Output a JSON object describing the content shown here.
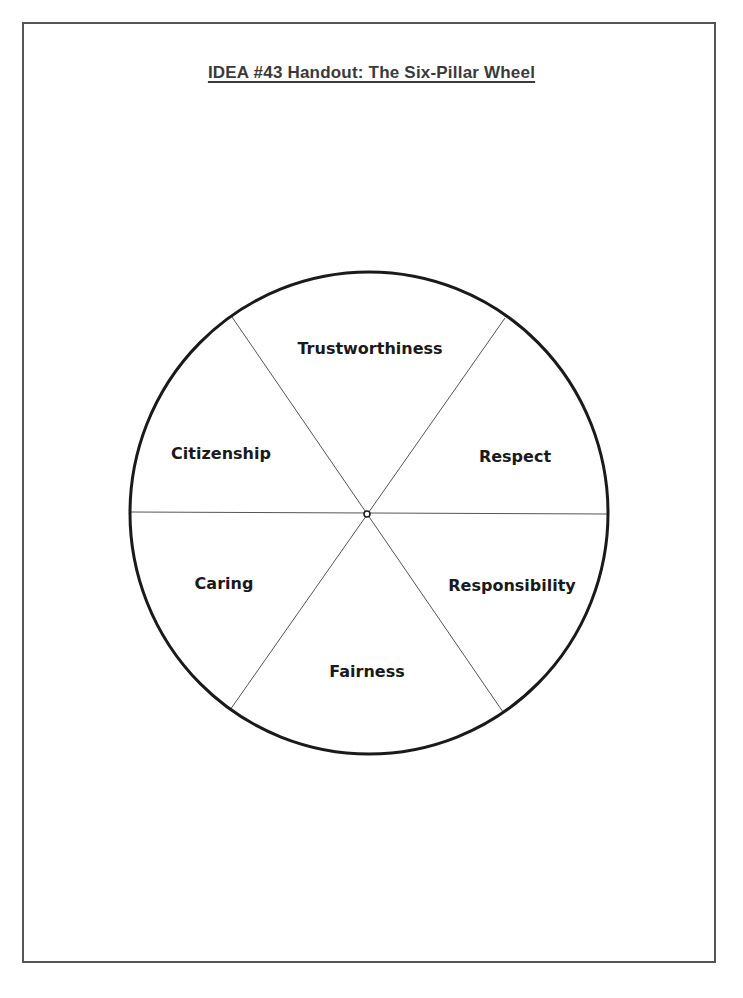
{
  "document": {
    "title": "IDEA #43 Handout: The Six-Pillar Wheel"
  },
  "wheel": {
    "center": [
      368,
      513
    ],
    "radius": 240,
    "segments": [
      {
        "label": "Trustworthiness",
        "x": 370,
        "y": 354
      },
      {
        "label": "Respect",
        "x": 515,
        "y": 462
      },
      {
        "label": "Responsibility",
        "x": 512,
        "y": 591
      },
      {
        "label": "Fairness",
        "x": 367,
        "y": 677
      },
      {
        "label": "Caring",
        "x": 224,
        "y": 589
      },
      {
        "label": "Citizenship",
        "x": 221,
        "y": 459
      }
    ]
  }
}
